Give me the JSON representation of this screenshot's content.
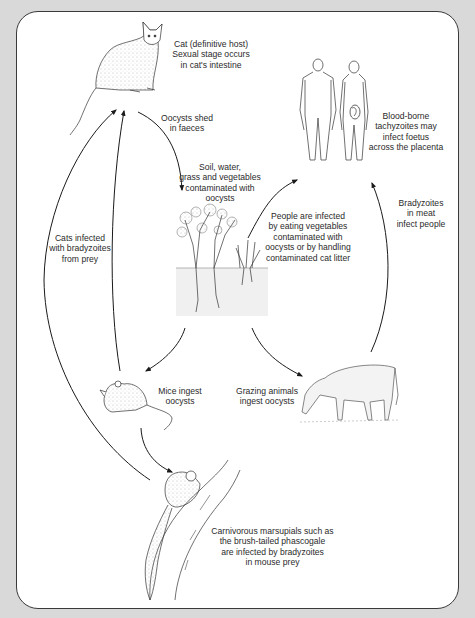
{
  "diagram": {
    "type": "life-cycle",
    "nodes": [
      {
        "id": "cat",
        "illustration": "cat-illustration",
        "label": "Cat (definitive host)\nSexual stage occurs\nin cat's intestine"
      },
      {
        "id": "humans",
        "illustration": "humans-illustration",
        "label": "Blood-borne\ntachyzoites may\ninfect foetus\nacross the placenta"
      },
      {
        "id": "soil",
        "illustration": "plants-soil-illustration",
        "label": "Soil, water,\ngrass and vegetables\ncontaminated with\noocysts"
      },
      {
        "id": "mouse",
        "illustration": "mouse-illustration",
        "label": "Mice ingest\noocysts"
      },
      {
        "id": "cow",
        "illustration": "cow-illustration",
        "label": "Grazing animals\ningest oocysts"
      },
      {
        "id": "phascogale",
        "illustration": "phascogale-illustration",
        "label": "Carnivorous marsupials such as\nthe brush-tailed phascogale\nare infected by bradyzoites\nin mouse prey"
      }
    ],
    "edges": [
      {
        "from": "cat",
        "to": "soil",
        "label": "Oocysts shed\nin faeces"
      },
      {
        "from": "soil",
        "to": "humans",
        "label": "People are infected\nby eating vegetables\ncontaminated with\noocysts or by handling\ncontaminated cat litter"
      },
      {
        "from": "cow",
        "to": "humans",
        "label": "Bradyzoites\nin meat\ninfect people"
      },
      {
        "from": "soil",
        "to": "mouse",
        "label": ""
      },
      {
        "from": "soil",
        "to": "cow",
        "label": ""
      },
      {
        "from": "mouse",
        "to": "cat",
        "label": "Cats infected\nwith bradyzoites\nfrom prey"
      },
      {
        "from": "mouse",
        "to": "phascogale",
        "label": ""
      },
      {
        "from": "phascogale",
        "to": "cat",
        "label": ""
      }
    ]
  },
  "labels": {
    "cat": "Cat (definitive host)\nSexual stage occurs\nin cat's intestine",
    "oocysts_shed": "Oocysts shed\nin faeces",
    "humans": "Blood-borne\ntachyzoites may\ninfect foetus\nacross the placenta",
    "soil": "Soil, water,\ngrass and vegetables\ncontaminated with\noocysts",
    "people_infected": "People are infected\nby eating vegetables\ncontaminated with\noocysts or by handling\ncontaminated cat litter",
    "bradyzoites_meat": "Bradyzoites\nin meat\ninfect people",
    "cats_infected": "Cats infected\nwith bradyzoites\nfrom prey",
    "mice": "Mice ingest\noocysts",
    "grazing": "Grazing animals\ningest oocysts",
    "marsupials": "Carnivorous marsupials such as\nthe brush-tailed phascogale\nare infected by bradyzoites\nin mouse prey"
  },
  "colors": {
    "frame": "#d9d9d9",
    "panel": "#ffffff",
    "line": "#1a1a1a",
    "text": "#2a2a2a",
    "soil": "#f0f0f0"
  }
}
